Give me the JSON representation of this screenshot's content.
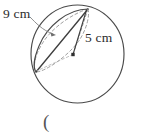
{
  "figure": {
    "type": "geometry-diagram",
    "labels": {
      "chord_label": "9 cm",
      "radius_label": "5 cm"
    },
    "trailing_text": "(",
    "colors": {
      "outline": "#4a4a4a",
      "construction": "#8a8a8a",
      "dashed": "#9a9a9a",
      "text": "#2b2b2b",
      "background": "#ffffff"
    },
    "geometry": {
      "sphere_outline": {
        "center_x": 77.5,
        "center_y": 54,
        "radius": 46.5
      },
      "center_point": {
        "x": 73,
        "y": 54.5
      },
      "apex_point": {
        "x": 88,
        "y": 9
      },
      "left_point": {
        "x": 36,
        "y": 72
      }
    }
  }
}
